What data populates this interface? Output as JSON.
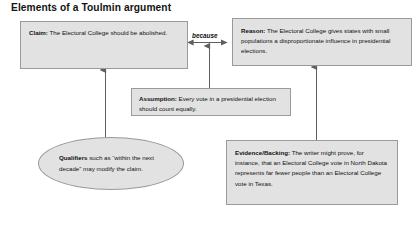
{
  "title": "Elements of a Toulmin argument",
  "theme": {
    "node_fill": "#e2e2e2",
    "node_border": "#9a9a9a",
    "connector": "#6d6d6d",
    "text": "#111111",
    "background": "#ffffff"
  },
  "nodes": {
    "claim": {
      "lead": "Claim:",
      "body": " The Electoral College should be abolished."
    },
    "reason": {
      "lead": "Reason:",
      "body": " The Electoral College gives states with small populations a disproportionate influence in presidential elections."
    },
    "assumption": {
      "lead": "Assumption:",
      "body": " Every vote in a presidential election should count equally."
    },
    "evidence": {
      "lead": "Evidence/Backing:",
      "body": " The writer might prove, for instance, that an Electoral College vote in North Dakota represents far fewer people than an Electoral College vote in Texas."
    },
    "qualifiers": {
      "lead": "Qualifiers",
      "body": " such as “within the next decade” may modify the claim."
    }
  },
  "connectors": {
    "because_label": "because",
    "items": [
      {
        "name": "claim-to-reason",
        "style": "double-arrow-horizontal"
      },
      {
        "name": "assumption-to-because",
        "style": "arrow-up"
      },
      {
        "name": "qualifiers-to-claim",
        "style": "arrow-up"
      },
      {
        "name": "evidence-to-reason",
        "style": "arrow-up"
      }
    ]
  }
}
